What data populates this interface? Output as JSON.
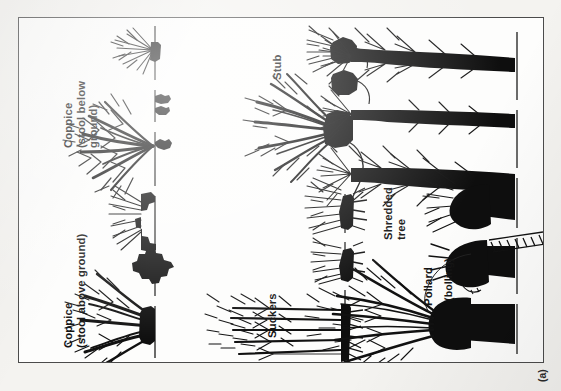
{
  "figure": {
    "kind": "line-drawing-plate",
    "caption_marker": "(a)",
    "panels": [
      {
        "id": "coppice-stool-below-ground",
        "label": "Coppice\n(stool below\nground)",
        "label_lines": [
          "Coppice",
          "(stool below",
          "ground)"
        ],
        "description": "Multi-stemmed regrowth from a stool buried beneath the ground line; three growth stages shown."
      },
      {
        "id": "stub",
        "label": "Stub",
        "label_lines": [
          "Stub"
        ],
        "description": "Short cut stem with dense regrowth sprouting from a low blackened head."
      },
      {
        "id": "shredded-tree",
        "label": "Shredded\ntree",
        "label_lines": [
          "Shredded",
          "tree"
        ],
        "description": "Tall single trunk with side branches repeatedly trimmed along its length."
      },
      {
        "id": "coppice-stool-above-ground",
        "label": "Coppice\n(stool above ground)",
        "label_lines": [
          "Coppice",
          "(stool above ground)"
        ],
        "description": "Multi-stemmed regrowth from a raised stool sitting on the ground line."
      },
      {
        "id": "suckers",
        "label": "Suckers",
        "label_lines": [
          "Suckers"
        ],
        "description": "Shoots arising from a spreading underground root system."
      },
      {
        "id": "pollard",
        "label": "Pollard",
        "label_lines": [
          "Pollard"
        ],
        "annotation": "(bolling)",
        "annotation_target": "bolling",
        "description": "Tree cut above browsing height; regrowth springs from a swollen trunk head called the bolling. A ladder leans against the trunk."
      }
    ],
    "ground_line_label": "ground line"
  },
  "colors": {
    "paper": "#f4f3f0",
    "plate_fill": "#fdfdfc",
    "ink": "#111111",
    "frame": "#4b4b4b",
    "ground_line": "#3a3a3a"
  }
}
